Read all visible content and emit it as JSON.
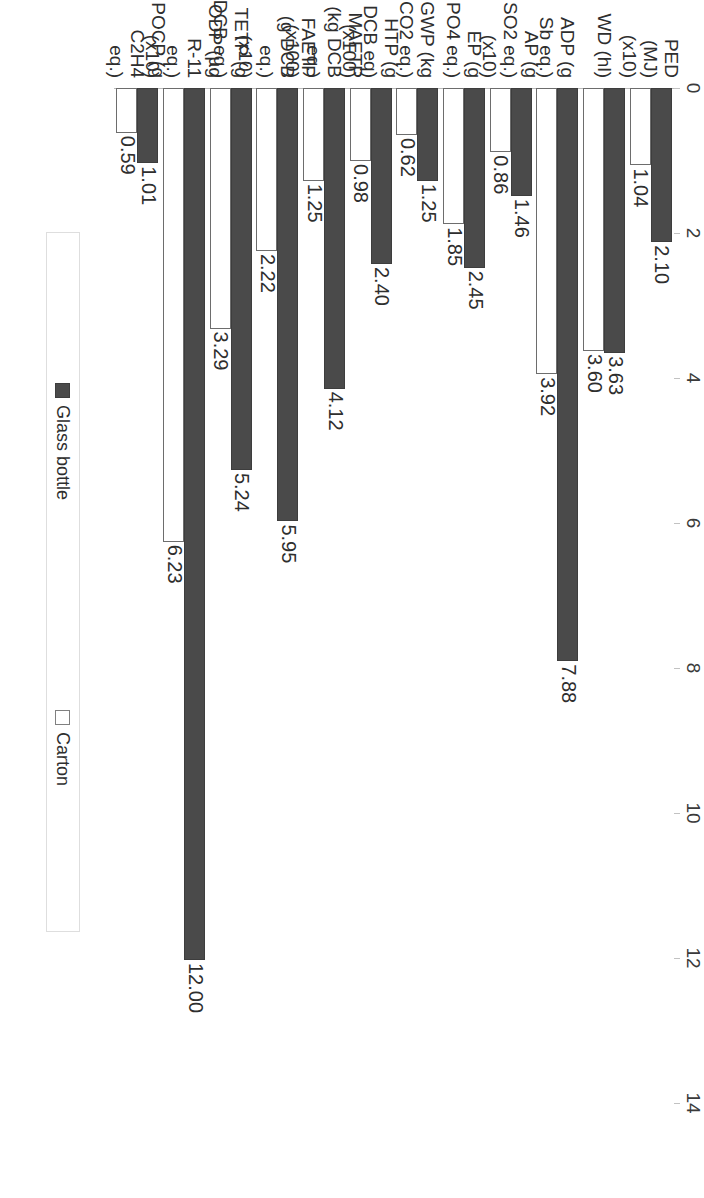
{
  "chart_data": {
    "type": "bar",
    "orientation": "horizontal",
    "title": "",
    "xlabel": "",
    "ylabel": "",
    "xlim": [
      0,
      14
    ],
    "xticks": [
      0,
      2,
      4,
      6,
      8,
      10,
      12,
      14
    ],
    "xtick_labels": [
      "0",
      "2",
      "4",
      "6",
      "8",
      "10",
      "12",
      "14"
    ],
    "grid": false,
    "legend_position": "right",
    "categories": [
      {
        "lines": [
          "PED",
          "(MJ)",
          "(x10)"
        ]
      },
      {
        "lines": [
          "WD (hl)"
        ]
      },
      {
        "lines": [
          "ADP (g",
          "Sb eq.)"
        ]
      },
      {
        "lines": [
          "AP (g",
          "SO2 eq.)",
          "(x10)"
        ]
      },
      {
        "lines": [
          "EP (g",
          "PO4 eq.)"
        ]
      },
      {
        "lines": [
          "GWP (kg",
          "CO2 eq.)"
        ]
      },
      {
        "lines": [
          "HTP (g",
          "DCB eq)",
          "(x100)"
        ]
      },
      {
        "lines": [
          "MAETP",
          "(kg DCB",
          "eq.)",
          "(x100)"
        ]
      },
      {
        "lines": [
          "FAETP",
          "(g DCB",
          "eq.)",
          "(x10)"
        ]
      },
      {
        "lines": [
          "TETP (g",
          "DCB eq.)"
        ]
      },
      {
        "lines": [
          "ODP (µg",
          "R-11",
          "eq.)",
          "(x10)"
        ]
      },
      {
        "lines": [
          "POCP (g",
          "C2H4",
          "eq.)"
        ]
      }
    ],
    "series": [
      {
        "name": "Glass bottle",
        "swatch": "dark",
        "color": "#4a4a4a",
        "values": [
          2.1,
          3.63,
          7.88,
          1.46,
          2.45,
          1.25,
          2.4,
          4.12,
          5.95,
          5.24,
          12.0,
          1.01
        ],
        "labels": [
          "2.10",
          "3.63",
          "7.88",
          "1.46",
          "2.45",
          "1.25",
          "2.40",
          "4.12",
          "5.95",
          "5.24",
          "12.00",
          "1.01"
        ]
      },
      {
        "name": "Carton",
        "swatch": "light",
        "color": "#ffffff",
        "values": [
          1.04,
          3.6,
          3.92,
          0.86,
          1.85,
          0.62,
          0.98,
          1.25,
          2.22,
          3.29,
          6.23,
          0.59
        ],
        "labels": [
          "1.04",
          "3.60",
          "3.92",
          "0.86",
          "1.85",
          "0.62",
          "0.98",
          "1.25",
          "2.22",
          "3.29",
          "6.23",
          "0.59"
        ]
      }
    ]
  },
  "legend": {
    "items": [
      {
        "label": "Glass bottle",
        "swatch": "dark"
      },
      {
        "label": "Carton",
        "swatch": "light"
      }
    ]
  },
  "colors": {
    "glass_bottle": "#4a4a4a",
    "carton": "#ffffff",
    "axis": "#b9b9b9",
    "text": "#2e2e2e"
  }
}
